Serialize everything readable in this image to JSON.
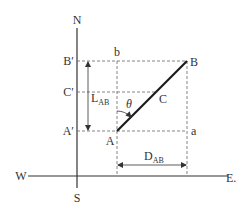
{
  "diagram": {
    "type": "coordinate-geometry",
    "colors": {
      "line": "#333333",
      "dashed": "#666666",
      "segment": "#1a1a1a",
      "background": "#ffffff"
    },
    "axes": {
      "north": "N",
      "south": "S",
      "west": "W",
      "east": "E."
    },
    "points": {
      "A": "A",
      "B": "B",
      "C": "C",
      "a": "a",
      "b": "b",
      "A_prime": "A′",
      "B_prime": "B′",
      "C_prime": "C′"
    },
    "angle": "θ",
    "latitude": {
      "main": "L",
      "sub": "AB"
    },
    "departure": {
      "main": "D",
      "sub": "AB"
    }
  }
}
